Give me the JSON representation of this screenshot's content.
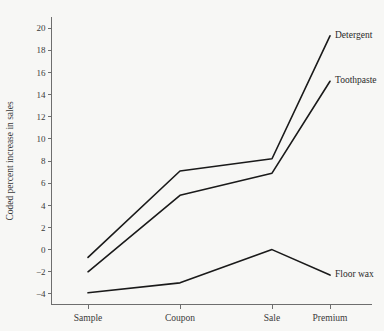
{
  "chart_data": {
    "type": "line",
    "title": "",
    "xlabel": "",
    "ylabel": "Coded percent increase in sales",
    "categories": [
      "Sample",
      "Coupon",
      "Sale",
      "Premium"
    ],
    "ylim": [
      -5,
      21
    ],
    "yticks": [
      -4,
      -2,
      0,
      2,
      4,
      6,
      8,
      10,
      12,
      14,
      16,
      18,
      20
    ],
    "ytick_labels": [
      "-4",
      "-2",
      "0",
      "2",
      "4",
      "6",
      "8",
      "10",
      "12",
      "14",
      "16",
      "18",
      "20"
    ],
    "grid": false,
    "legend_position": "right-endpoint-labels",
    "series": [
      {
        "name": "Detergent",
        "values": [
          -0.7,
          7.1,
          8.2,
          19.3
        ],
        "color": "#1a1a1a"
      },
      {
        "name": "Toothpaste",
        "values": [
          -2.0,
          4.9,
          6.9,
          15.2
        ],
        "color": "#1a1a1a"
      },
      {
        "name": "Floor wax",
        "values": [
          -3.9,
          -3.0,
          0.0,
          -2.3
        ],
        "color": "#1a1a1a"
      }
    ]
  },
  "axis": {
    "y_title": "Coded percent increase in sales"
  },
  "colors": {
    "background": "#f7f7f5",
    "axis": "#6e6e6e",
    "line": "#1a1a1a",
    "text": "#3a3a3a"
  }
}
